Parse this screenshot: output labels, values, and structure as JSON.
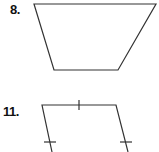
{
  "problems": [
    {
      "number": "8.",
      "shape": "trapezoid",
      "vertices": [
        [
          34,
          4
        ],
        [
          156,
          4
        ],
        [
          118,
          70
        ],
        [
          54,
          70
        ]
      ],
      "tick_marks": []
    },
    {
      "number": "11.",
      "shape": "quadrilateral",
      "vertices": [
        [
          42,
          105
        ],
        [
          116,
          105
        ],
        [
          128,
          152
        ],
        [
          52,
          152
        ]
      ],
      "tick_marks": [
        "top-edge-single",
        "left-edge-single",
        "right-edge-single"
      ]
    }
  ],
  "colors": {
    "stroke": "#333333",
    "label": "#111111",
    "background": "#ffffff"
  }
}
